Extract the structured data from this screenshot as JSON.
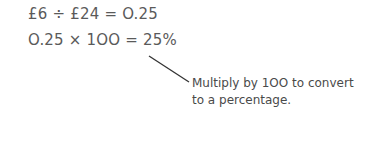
{
  "equations": [
    "£6 ÷ £24 = O.25",
    "O.25 × 1OO = 25%"
  ],
  "annotation": {
    "lines": [
      "Multiply by 1OO to convert",
      "to a percentage."
    ]
  },
  "colors": {
    "text": "#5a5a5a",
    "pointer_line": "#333333"
  }
}
